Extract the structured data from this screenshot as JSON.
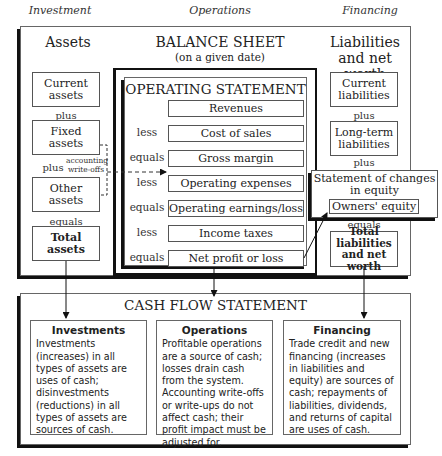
{
  "columns": {
    "investment": "Investment",
    "operations": "Operations",
    "financing": "Financing"
  },
  "balance_sheet": {
    "title": "BALANCE SHEET",
    "subtitle": "(on a given date)",
    "assets": {
      "heading": "Assets",
      "items": [
        "Current assets",
        "Fixed assets",
        "Other assets"
      ],
      "connectors": [
        "plus",
        "plus",
        "equals"
      ],
      "total": "Total assets",
      "writeoff_label": "accounting write-offs"
    },
    "liabilities": {
      "heading": "Liabilities and net worth",
      "items": [
        "Current liabilities",
        "Long-term liabilities"
      ],
      "connectors": [
        "plus",
        "plus",
        "equals"
      ],
      "total": "Total liabilities and net worth"
    }
  },
  "operating_statement": {
    "title": "OPERATING STATEMENT",
    "rows": [
      {
        "op": "",
        "label": "Revenues"
      },
      {
        "op": "less",
        "label": "Cost of sales"
      },
      {
        "op": "equals",
        "label": "Gross margin"
      },
      {
        "op": "less",
        "label": "Operating expenses"
      },
      {
        "op": "equals",
        "label": "Operating earnings/loss"
      },
      {
        "op": "less",
        "label": "Income taxes"
      },
      {
        "op": "equals",
        "label": "Net profit or loss"
      }
    ]
  },
  "equity_statement": {
    "title": "Statement of changes in equity",
    "item": "Owners' equity"
  },
  "cash_flow": {
    "title": "CASH FLOW STATEMENT",
    "sections": [
      {
        "title": "Investments",
        "body": "Investments (increases) in all types of assets are uses of cash; disinvestments (reductions) in all types of assets are sources of cash."
      },
      {
        "title": "Operations",
        "body": "Profitable operations are a source of cash; losses drain cash from the system. Accounting write-offs or write-ups do not affect cash; their profit impact must be adjusted for."
      },
      {
        "title": "Financing",
        "body": "Trade credit and new financing (increases in liabilities and equity) are sources of cash; repayments of liabilities, dividends, and returns of capital are uses of cash."
      }
    ]
  }
}
